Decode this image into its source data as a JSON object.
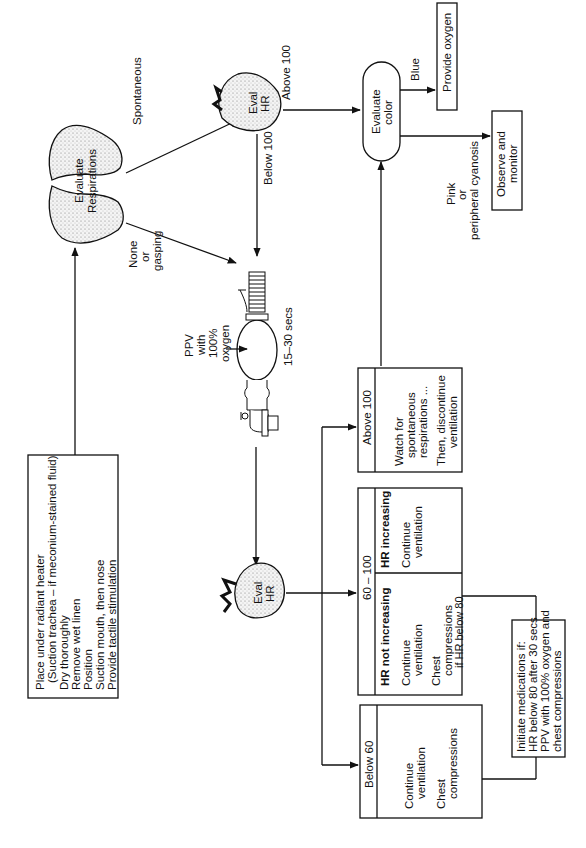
{
  "diagram": {
    "orientation": "rotated 90 degrees counter-clockwise",
    "initial_steps": {
      "lines": [
        "Place under radiant heater",
        "(Suction trachea – if meconium-stained fluid)",
        "Dry thoroughly",
        "Remove wet linen",
        "Position",
        "Suction mouth, then nose",
        "Provide tactile stimulation"
      ]
    },
    "evaluate_respirations": {
      "line1": "Evaluate",
      "line2": "Respirations"
    },
    "labels": {
      "spontaneous": "Spontaneous",
      "none": "None",
      "or": "or",
      "gasping": "gasping",
      "above_100_top": "Above 100",
      "below_100": "Below 100",
      "blue": "Blue",
      "pink": "Pink",
      "pink_or": "or",
      "peripheral_cyanosis": "peripheral cyanosis",
      "duration": "15–30 secs"
    },
    "eval_hr": {
      "line1": "Eval",
      "line2": "HR"
    },
    "ppv": {
      "line1": "PPV",
      "line2": "with",
      "line3": "100%",
      "line4": "oxygen"
    },
    "evaluate_color": {
      "line1": "Evaluate",
      "line2": "color"
    },
    "provide_oxygen": "Provide oxygen",
    "observe_monitor": {
      "line1": "Observe and",
      "line2": "monitor"
    },
    "boxes": {
      "above_100": {
        "header": "Above 100",
        "lines": [
          "Watch for",
          "spontaneous",
          "respirations ...",
          "Then, discontinue",
          "ventilation"
        ]
      },
      "range_60_100": {
        "header": "60 – 100",
        "not_increasing": {
          "title": "HR not increasing",
          "lines": [
            "Continue",
            "ventilation",
            "Chest",
            "compressions",
            "if HR below 80"
          ]
        },
        "increasing": {
          "title": "HR increasing",
          "lines": [
            "Continue",
            "ventilation"
          ]
        }
      },
      "below_60": {
        "header": "Below 60",
        "lines": [
          "Continue",
          "ventilation",
          "Chest",
          "compressions"
        ]
      }
    },
    "medications": {
      "lines": [
        "Initiate medications if:",
        "HR below 80 after 30 secs",
        "PPV with 100% oxygen and",
        "chest compressions"
      ]
    }
  }
}
